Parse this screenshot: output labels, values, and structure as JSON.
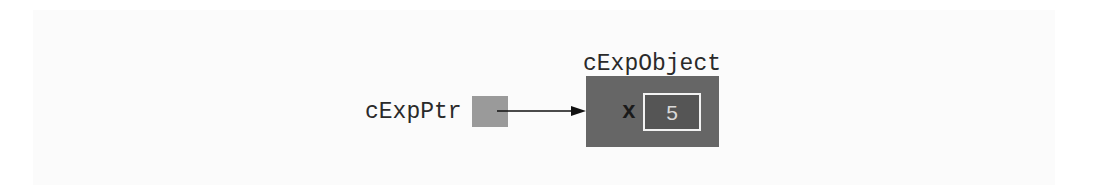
{
  "diagram": {
    "pointer": {
      "label": "cExpPtr",
      "color": "#9a9a9a"
    },
    "object": {
      "title": "cExpObject",
      "color": "#666666",
      "field": {
        "name": "x",
        "value": "5",
        "value_box_color": "#555555",
        "value_border_color": "#f2f2f2"
      }
    },
    "arrow": {
      "from": "cExpPtr",
      "to": "cExpObject",
      "color": "#111111"
    }
  }
}
